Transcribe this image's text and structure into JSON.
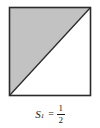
{
  "figure": {
    "shape": {
      "name": "square-with-diagonal",
      "square": {
        "x": 9.5,
        "y": 7.5,
        "width": 81,
        "height": 88,
        "stroke_color": "#2b2b2b",
        "stroke_width": 1.6,
        "fill_color": "#ffffff"
      },
      "shaded_triangle": {
        "description": "upper-left triangle",
        "points": "9.5,7.5 90.5,7.5 9.5,95.5",
        "fill_color": "#c2c2c2"
      },
      "diagonal": {
        "x1": 90.5,
        "y1": 7.5,
        "x2": 9.5,
        "y2": 95.5,
        "stroke_color": "#2b2b2b",
        "stroke_width": 1.3
      }
    },
    "caption": {
      "symbol": "S",
      "subscript": "1",
      "equals": "=",
      "fraction_numerator": "1",
      "fraction_denominator": "2",
      "full_text": "S1 = 1/2"
    }
  }
}
